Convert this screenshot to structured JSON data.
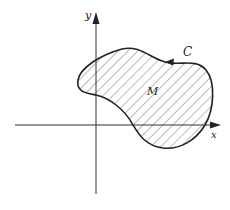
{
  "diagram": {
    "type": "region-with-boundary-curve",
    "axes": {
      "x_label": "x",
      "y_label": "y",
      "color": "#333333"
    },
    "region": {
      "label": "M",
      "fill": "hatched",
      "hatch_color": "#555555"
    },
    "boundary": {
      "label": "C",
      "orientation": "counterclockwise",
      "color": "#222222"
    }
  }
}
